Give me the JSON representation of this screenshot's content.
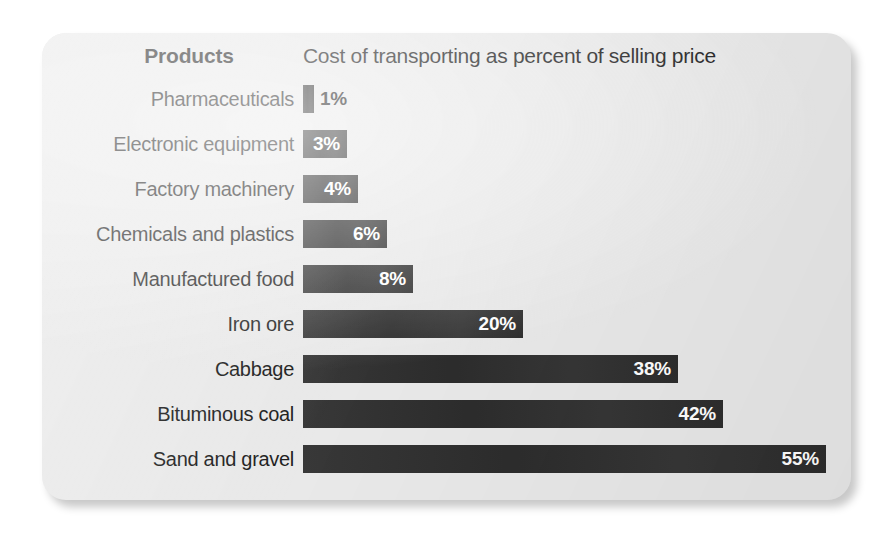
{
  "card": {
    "background_color": "#e9e9e9",
    "bar_color": "#2f2f2f",
    "text_color": "#1d1d1d"
  },
  "header": {
    "products_label": "Products",
    "metric_label": "Cost of transporting as percent of selling price"
  },
  "chart_data": {
    "type": "bar",
    "orientation": "horizontal",
    "title": "Cost of transporting as percent of selling price",
    "xlabel": "Cost of transporting as percent of selling price",
    "ylabel": "Products",
    "grid": false,
    "legend": null,
    "xlim": [
      0,
      55
    ],
    "unit": "%",
    "categories": [
      "Pharmaceuticals",
      "Electronic equipment",
      "Factory machinery",
      "Chemicals and plastics",
      "Manufactured food",
      "Iron ore",
      "Cabbage",
      "Bituminous coal",
      "Sand and gravel"
    ],
    "values": [
      1,
      3,
      4,
      6,
      8,
      20,
      38,
      42,
      55
    ],
    "data_labels": [
      "1%",
      "3%",
      "4%",
      "6%",
      "8%",
      "20%",
      "38%",
      "42%",
      "55%"
    ],
    "rows": [
      {
        "label": "Pharmaceuticals",
        "value": 1,
        "display": "1%",
        "bar_px": 11,
        "label_inside": false
      },
      {
        "label": "Electronic equipment",
        "value": 3,
        "display": "3%",
        "bar_px": 44,
        "label_inside": true
      },
      {
        "label": "Factory machinery",
        "value": 4,
        "display": "4%",
        "bar_px": 55,
        "label_inside": true
      },
      {
        "label": "Chemicals and plastics",
        "value": 6,
        "display": "6%",
        "bar_px": 84,
        "label_inside": true
      },
      {
        "label": "Manufactured food",
        "value": 8,
        "display": "8%",
        "bar_px": 110,
        "label_inside": true
      },
      {
        "label": "Iron ore",
        "value": 20,
        "display": "20%",
        "bar_px": 220,
        "label_inside": true
      },
      {
        "label": "Cabbage",
        "value": 38,
        "display": "38%",
        "bar_px": 375,
        "label_inside": true
      },
      {
        "label": "Bituminous coal",
        "value": 42,
        "display": "42%",
        "bar_px": 420,
        "label_inside": true
      },
      {
        "label": "Sand and gravel",
        "value": 55,
        "display": "55%",
        "bar_px": 523,
        "label_inside": true
      }
    ]
  }
}
